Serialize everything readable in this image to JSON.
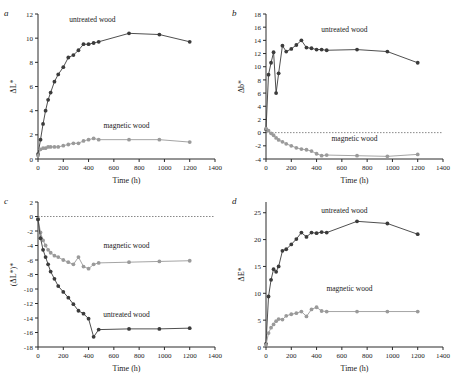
{
  "figure": {
    "background": "#ffffff",
    "untreated_color": "#3b3b3b",
    "magnetic_color": "#9a9a9a"
  },
  "panels": [
    {
      "letter": "a",
      "xlabel": "Time (h)",
      "ylabel": "ΔL*",
      "xticks": [
        0,
        200,
        400,
        600,
        800,
        1000,
        1200,
        1400
      ],
      "yticks": [
        0,
        2,
        4,
        6,
        8,
        10,
        12
      ],
      "xlim": [
        0,
        1400
      ],
      "ylim": [
        0,
        12
      ],
      "annotations": [
        {
          "text": "untreated wood",
          "x": 430,
          "y": 11.3
        },
        {
          "text": "magnetic wood",
          "x": 700,
          "y": 2.6
        }
      ],
      "chart_data": {
        "type": "line",
        "title": "",
        "xlabel": "Time (h)",
        "ylabel": "ΔL*",
        "xlim": [
          0,
          1400
        ],
        "ylim": [
          0,
          12
        ],
        "grid": false,
        "legend": "inline-annotation",
        "series": [
          {
            "name": "untreated wood",
            "color": "#3b3b3b",
            "x": [
              0,
              20,
              40,
              60,
              80,
              100,
              130,
              160,
              200,
              240,
              280,
              320,
              360,
              400,
              440,
              480,
              720,
              960,
              1200
            ],
            "y": [
              0.4,
              1.6,
              2.9,
              4.0,
              4.9,
              5.5,
              6.4,
              7.0,
              7.6,
              8.4,
              8.6,
              9.0,
              9.5,
              9.5,
              9.6,
              9.7,
              10.4,
              10.3,
              9.7
            ]
          },
          {
            "name": "magnetic wood",
            "color": "#9a9a9a",
            "x": [
              0,
              20,
              40,
              60,
              80,
              100,
              130,
              160,
              200,
              240,
              280,
              320,
              360,
              400,
              440,
              480,
              720,
              960,
              1200
            ],
            "y": [
              0.3,
              0.8,
              0.9,
              0.9,
              1.0,
              1.0,
              1.0,
              1.0,
              1.1,
              1.2,
              1.3,
              1.3,
              1.5,
              1.6,
              1.7,
              1.6,
              1.6,
              1.6,
              1.4
            ]
          }
        ]
      }
    },
    {
      "letter": "b",
      "xlabel": "Time (h)",
      "ylabel": "Δb*",
      "xticks": [
        0,
        200,
        400,
        600,
        800,
        1000,
        1200,
        1400
      ],
      "yticks": [
        -4,
        -2,
        0,
        2,
        4,
        6,
        8,
        10,
        12,
        14,
        16,
        18
      ],
      "xlim": [
        0,
        1400
      ],
      "ylim": [
        -4,
        18
      ],
      "annotations": [
        {
          "text": "untreated wood",
          "x": 620,
          "y": 15.2
        },
        {
          "text": "magnetic wood",
          "x": 700,
          "y": -1.2
        }
      ],
      "chart_data": {
        "type": "line",
        "title": "",
        "xlabel": "Time (h)",
        "ylabel": "Δb*",
        "xlim": [
          0,
          1400
        ],
        "ylim": [
          -4,
          18
        ],
        "grid": false,
        "legend": "inline-annotation",
        "series": [
          {
            "name": "untreated wood",
            "color": "#3b3b3b",
            "x": [
              0,
              20,
              40,
              60,
              80,
              100,
              130,
              160,
              200,
              240,
              280,
              320,
              360,
              400,
              440,
              480,
              720,
              960,
              1200
            ],
            "y": [
              0.5,
              8.8,
              10.6,
              12.2,
              6.0,
              9.0,
              13.2,
              12.3,
              12.7,
              13.3,
              14.0,
              12.9,
              12.8,
              12.6,
              12.6,
              12.5,
              12.6,
              12.3,
              10.6
            ]
          },
          {
            "name": "magnetic wood",
            "color": "#9a9a9a",
            "x": [
              0,
              20,
              40,
              60,
              80,
              100,
              130,
              160,
              200,
              240,
              280,
              320,
              360,
              400,
              440,
              480,
              720,
              960,
              1200
            ],
            "y": [
              0.6,
              0.3,
              -0.1,
              -0.4,
              -0.8,
              -1.1,
              -1.4,
              -1.7,
              -2.0,
              -2.3,
              -2.5,
              -2.6,
              -2.8,
              -3.2,
              -3.5,
              -3.4,
              -3.5,
              -3.6,
              -3.3
            ]
          }
        ]
      }
    },
    {
      "letter": "c",
      "xlabel": "Time (h)",
      "ylabel": "(ΔL*)*",
      "xticks": [
        0,
        200,
        400,
        600,
        800,
        1000,
        1200,
        1400
      ],
      "yticks": [
        -18,
        -16,
        -14,
        -12,
        -10,
        -8,
        -6,
        -4,
        -2,
        0,
        2
      ],
      "xlim": [
        0,
        1400
      ],
      "ylim": [
        -18,
        2
      ],
      "annotations": [
        {
          "text": "magnetic wood",
          "x": 700,
          "y": -4.3
        },
        {
          "text": "untreated wood",
          "x": 700,
          "y": -13.8
        }
      ],
      "chart_data": {
        "type": "line",
        "title": "",
        "xlabel": "Time (h)",
        "ylabel": "(ΔL*)*",
        "xlim": [
          0,
          1400
        ],
        "ylim": [
          -18,
          2
        ],
        "grid": false,
        "legend": "inline-annotation",
        "series": [
          {
            "name": "magnetic wood",
            "color": "#9a9a9a",
            "x": [
              0,
              20,
              40,
              60,
              80,
              100,
              130,
              160,
              200,
              240,
              280,
              320,
              360,
              400,
              440,
              480,
              720,
              960,
              1200
            ],
            "y": [
              -0.3,
              -2.2,
              -3.3,
              -4.0,
              -4.6,
              -5.0,
              -5.4,
              -5.6,
              -6.0,
              -6.3,
              -6.6,
              -5.6,
              -6.9,
              -7.2,
              -6.6,
              -6.4,
              -6.3,
              -6.2,
              -6.1
            ]
          },
          {
            "name": "untreated wood",
            "color": "#3b3b3b",
            "x": [
              0,
              20,
              40,
              60,
              80,
              100,
              130,
              160,
              200,
              240,
              280,
              320,
              360,
              400,
              440,
              480,
              720,
              960,
              1200
            ],
            "y": [
              -0.4,
              -3.0,
              -4.6,
              -5.6,
              -6.6,
              -7.6,
              -8.6,
              -9.6,
              -10.4,
              -11.2,
              -12.1,
              -13.0,
              -13.4,
              -14.1,
              -16.6,
              -15.6,
              -15.5,
              -15.5,
              -15.4
            ]
          }
        ]
      }
    },
    {
      "letter": "d",
      "xlabel": "Time (h)",
      "ylabel": "ΔE*",
      "xticks": [
        0,
        200,
        400,
        600,
        800,
        1000,
        1200,
        1400
      ],
      "yticks": [
        0,
        5,
        10,
        15,
        20,
        25
      ],
      "xlim": [
        0,
        1400
      ],
      "ylim": [
        0,
        27
      ],
      "annotations": [
        {
          "text": "untreated wood",
          "x": 620,
          "y": 25.0
        },
        {
          "text": "magnetic wood",
          "x": 660,
          "y": 10.5
        }
      ],
      "chart_data": {
        "type": "line",
        "title": "",
        "xlabel": "Time (h)",
        "ylabel": "ΔE*",
        "xlim": [
          0,
          1400
        ],
        "ylim": [
          0,
          27
        ],
        "grid": false,
        "legend": "inline-annotation",
        "series": [
          {
            "name": "untreated wood",
            "color": "#3b3b3b",
            "x": [
              0,
              20,
              40,
              60,
              80,
              100,
              130,
              160,
              200,
              240,
              280,
              320,
              360,
              400,
              440,
              480,
              720,
              960,
              1200
            ],
            "y": [
              0.6,
              9.4,
              12.5,
              14.5,
              14.0,
              15.0,
              17.9,
              18.2,
              19.1,
              20.1,
              21.3,
              20.5,
              21.3,
              21.2,
              21.4,
              21.3,
              23.4,
              23.0,
              21.0
            ]
          },
          {
            "name": "magnetic wood",
            "color": "#9a9a9a",
            "x": [
              0,
              20,
              40,
              60,
              80,
              100,
              130,
              160,
              200,
              240,
              280,
              320,
              360,
              400,
              440,
              480,
              720,
              960,
              1200
            ],
            "y": [
              0.4,
              2.6,
              3.6,
              4.2,
              4.8,
              5.2,
              5.1,
              5.8,
              6.1,
              6.3,
              6.6,
              5.7,
              7.0,
              7.4,
              6.7,
              6.6,
              6.6,
              6.6,
              6.6
            ]
          }
        ]
      }
    }
  ]
}
